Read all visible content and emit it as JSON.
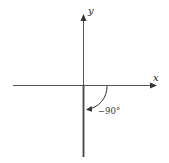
{
  "diagram": {
    "type": "coordinate-axes-angle",
    "axes": {
      "x_label": "x",
      "y_label": "y"
    },
    "angle": {
      "label": "−90°",
      "value_degrees": -90,
      "initial_side": "positive x-axis",
      "terminal_side": "negative y-axis",
      "direction": "clockwise"
    },
    "colors": {
      "axis": "#3a3a3a",
      "terminal_side": "#555555",
      "text": "#222222",
      "background": "#ffffff"
    }
  }
}
